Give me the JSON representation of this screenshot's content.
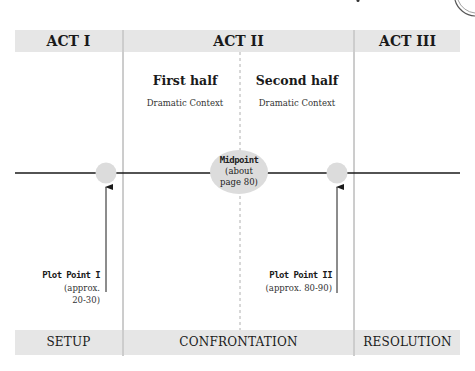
{
  "acts": [
    {
      "header": "ACT I",
      "footer": "SETUP"
    },
    {
      "header": "ACT II",
      "footer": "CONFRONTATION"
    },
    {
      "header": "ACT III",
      "footer": "RESOLUTION"
    }
  ],
  "act_two_halves": [
    {
      "title": "First half",
      "subtitle": "Dramatic Context"
    },
    {
      "title": "Second half",
      "subtitle": "Dramatic Context"
    }
  ],
  "midpoint": {
    "title": "Midpoint",
    "line1": "(about",
    "line2": "page 80)"
  },
  "plot_points": [
    {
      "title": "Plot Point I",
      "line1": "(approx.",
      "line2": "20-30)"
    },
    {
      "title": "Plot Point II",
      "line1": "(approx. 80-90)",
      "line2": ""
    }
  ],
  "colors": {
    "bar_fill": "#e6e6e6",
    "node_fill": "#dcdcdc",
    "line": "#1a1a1a",
    "divider": "#9a9a9a"
  }
}
